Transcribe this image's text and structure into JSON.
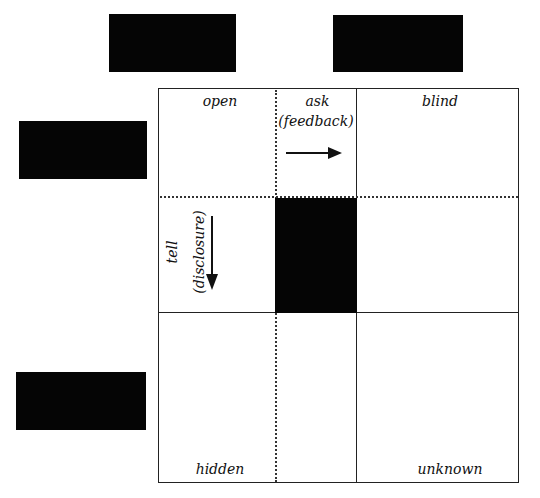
{
  "diagram": {
    "type": "johari-window",
    "redactions": [
      {
        "id": "top-left",
        "x": 109,
        "y": 14,
        "w": 127,
        "h": 58
      },
      {
        "id": "top-right",
        "x": 333,
        "y": 15,
        "w": 130,
        "h": 57
      },
      {
        "id": "left-upper",
        "x": 19,
        "y": 121,
        "w": 128,
        "h": 58
      },
      {
        "id": "left-lower",
        "x": 16,
        "y": 372,
        "w": 130,
        "h": 58
      },
      {
        "id": "center",
        "x": 275,
        "y": 198,
        "w": 82,
        "h": 115
      }
    ],
    "quadrants": {
      "open": "open",
      "blind": "blind",
      "hidden": "hidden",
      "unknown": "unknown"
    },
    "arrows": {
      "ask": {
        "label": "ask",
        "sublabel": "(feedback)",
        "direction": "right"
      },
      "tell": {
        "label": "tell",
        "sublabel": "(disclosure)",
        "direction": "down"
      }
    },
    "colors": {
      "line": "#222222",
      "redaction": "#050505",
      "background": "#ffffff"
    }
  }
}
